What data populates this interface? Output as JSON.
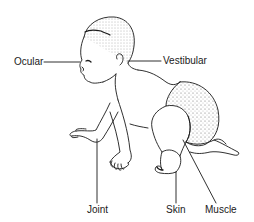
{
  "diagram": {
    "labels": {
      "ocular": "Ocular",
      "vestibular": "Vestibular",
      "joint": "Joint",
      "skin": "Skin",
      "muscle": "Muscle"
    },
    "colors": {
      "line": "#1a1a1a",
      "background": "#ffffff"
    }
  }
}
